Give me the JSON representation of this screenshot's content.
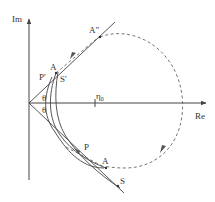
{
  "diagram": {
    "axes": {
      "x_label": "Re",
      "y_label": "Im"
    },
    "labels": {
      "a_double_prime": "A″",
      "a_upper": "A",
      "p_prime": "P′",
      "s_prime": "S′",
      "theta_upper": "θ",
      "theta_lower": "θ",
      "eta0": "η",
      "eta0_sub": "0",
      "p_lower": "P",
      "a_lower": "A",
      "s_lower": "S"
    },
    "colors": {
      "line": "#444444",
      "dashed": "#666666"
    }
  }
}
